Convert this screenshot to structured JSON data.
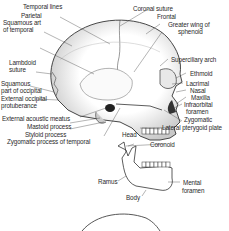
{
  "figure": {
    "line_color": "#333333",
    "shade_color": "#b8b8b8"
  },
  "labels_left": [
    {
      "id": "temporal-lines",
      "text": "Temporal lines"
    },
    {
      "id": "parietal",
      "text": "Parietal"
    },
    {
      "id": "squamous-temporal-1",
      "text": "Squamous art"
    },
    {
      "id": "squamous-temporal-2",
      "text": "of temporal"
    },
    {
      "id": "lambdoid-1",
      "text": "Lambdoid"
    },
    {
      "id": "lambdoid-2",
      "text": "suture"
    },
    {
      "id": "squamous-occipital-1",
      "text": "Squamous"
    },
    {
      "id": "squamous-occipital-2",
      "text": "part of occipital"
    },
    {
      "id": "ext-occipital-1",
      "text": "External occipital"
    },
    {
      "id": "ext-occipital-2",
      "text": "protuberance"
    },
    {
      "id": "ext-acoustic",
      "text": "External acoustic meatus"
    },
    {
      "id": "mastoid",
      "text": "Mastoid process"
    },
    {
      "id": "styloid",
      "text": "Styloid process"
    },
    {
      "id": "zygomatic-temporal",
      "text": "Zygomatic process of temporal"
    }
  ],
  "labels_right": [
    {
      "id": "coronal",
      "text": "Coronal suture"
    },
    {
      "id": "frontal",
      "text": "Frontal"
    },
    {
      "id": "greater-wing-1",
      "text": "Greater wing of"
    },
    {
      "id": "greater-wing-2",
      "text": "sphenoid"
    },
    {
      "id": "superciliary",
      "text": "Superciliary arch"
    },
    {
      "id": "ethmoid",
      "text": "Ethmoid"
    },
    {
      "id": "lacrimal",
      "text": "Lacrimal"
    },
    {
      "id": "nasal",
      "text": "Nasal"
    },
    {
      "id": "maxilla",
      "text": "Maxilla"
    },
    {
      "id": "infraorbital-1",
      "text": "Infraorbital"
    },
    {
      "id": "infraorbital-2",
      "text": "foramen"
    },
    {
      "id": "zygomatic",
      "text": "Zygomatic"
    },
    {
      "id": "lateral-pterygoid",
      "text": "Lateral pterygoid plate"
    }
  ],
  "labels_mandible": [
    {
      "id": "head",
      "text": "Head"
    },
    {
      "id": "coronoid",
      "text": "Coronoid"
    },
    {
      "id": "ramus",
      "text": "Ramus"
    },
    {
      "id": "mental-1",
      "text": "Mental"
    },
    {
      "id": "mental-2",
      "text": "foramen"
    },
    {
      "id": "body",
      "text": "Body"
    }
  ]
}
